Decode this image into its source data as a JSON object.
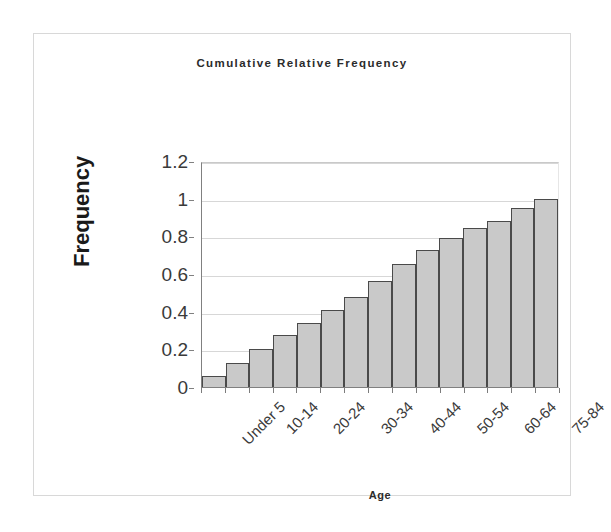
{
  "chart": {
    "title": "Cumulative Relative Frequency",
    "x_axis_title": "Age",
    "y_axis_title": "Frequency"
  },
  "chart_data": {
    "type": "bar",
    "title": "Cumulative Relative Frequency",
    "xlabel": "Age",
    "ylabel": "Frequency",
    "ylim": [
      0,
      1.2
    ],
    "grid": true,
    "legend": "none",
    "ytick_labels": [
      "0",
      "0.2",
      "0.4",
      "0.6",
      "0.8",
      "1",
      "1.2"
    ],
    "ytick_values": [
      0,
      0.2,
      0.4,
      0.6,
      0.8,
      1,
      1.2
    ],
    "categories": [
      "Under 5",
      "5-9",
      "10-14",
      "15-19",
      "20-24",
      "25-29",
      "30-34",
      "35-39",
      "40-44",
      "45-49",
      "50-54",
      "55-59",
      "60-64",
      "65-74",
      "75-84"
    ],
    "xtick_labels_shown": [
      "Under 5",
      "10-14",
      "20-24",
      "30-34",
      "40-44",
      "50-54",
      "60-64",
      "75-84"
    ],
    "values": [
      0.06,
      0.13,
      0.2,
      0.275,
      0.34,
      0.41,
      0.48,
      0.565,
      0.655,
      0.725,
      0.79,
      0.845,
      0.88,
      0.95,
      1.0
    ],
    "bar_fill_color": "#c9c9c9",
    "bar_border_color": "#4a4a4a",
    "gridline_color": "#d7d7d7",
    "axis_color": "#808080"
  }
}
